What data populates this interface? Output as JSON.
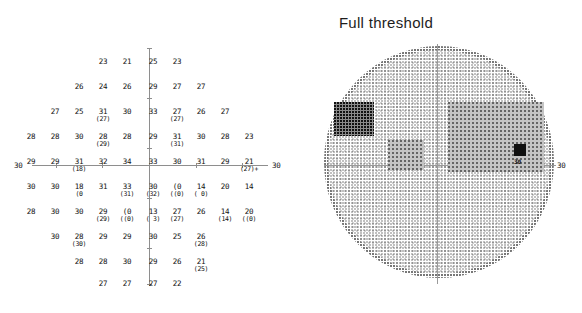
{
  "title": "Full threshold",
  "axis": {
    "left_label": "30",
    "right_label": "30",
    "fieldmap_right_label": "30"
  },
  "chart_data": {
    "type": "table",
    "title": "Full threshold",
    "subtitle": "",
    "xlabel": "",
    "ylabel": "",
    "units": "dB",
    "grid_rows": 10,
    "grid_columns": 10,
    "legend": [],
    "cells": [
      {
        "row": 0,
        "col": 3,
        "main": "23",
        "sub": ""
      },
      {
        "row": 0,
        "col": 4,
        "main": "21",
        "sub": ""
      },
      {
        "row": 0,
        "col": 5,
        "main": "25",
        "sub": ""
      },
      {
        "row": 0,
        "col": 6,
        "main": "23",
        "sub": ""
      },
      {
        "row": 1,
        "col": 2,
        "main": "26",
        "sub": ""
      },
      {
        "row": 1,
        "col": 3,
        "main": "24",
        "sub": ""
      },
      {
        "row": 1,
        "col": 4,
        "main": "26",
        "sub": ""
      },
      {
        "row": 1,
        "col": 5,
        "main": "29",
        "sub": ""
      },
      {
        "row": 1,
        "col": 6,
        "main": "27",
        "sub": ""
      },
      {
        "row": 1,
        "col": 7,
        "main": "27",
        "sub": ""
      },
      {
        "row": 2,
        "col": 1,
        "main": "27",
        "sub": ""
      },
      {
        "row": 2,
        "col": 2,
        "main": "25",
        "sub": ""
      },
      {
        "row": 2,
        "col": 3,
        "main": "31",
        "sub": "(27)"
      },
      {
        "row": 2,
        "col": 4,
        "main": "30",
        "sub": ""
      },
      {
        "row": 2,
        "col": 5,
        "main": "33",
        "sub": ""
      },
      {
        "row": 2,
        "col": 6,
        "main": "27",
        "sub": "(27)"
      },
      {
        "row": 2,
        "col": 7,
        "main": "26",
        "sub": ""
      },
      {
        "row": 2,
        "col": 8,
        "main": "27",
        "sub": ""
      },
      {
        "row": 3,
        "col": 0,
        "main": "28",
        "sub": ""
      },
      {
        "row": 3,
        "col": 1,
        "main": "28",
        "sub": ""
      },
      {
        "row": 3,
        "col": 2,
        "main": "30",
        "sub": ""
      },
      {
        "row": 3,
        "col": 3,
        "main": "28",
        "sub": "(29)"
      },
      {
        "row": 3,
        "col": 4,
        "main": "28",
        "sub": ""
      },
      {
        "row": 3,
        "col": 5,
        "main": "29",
        "sub": ""
      },
      {
        "row": 3,
        "col": 6,
        "main": "31",
        "sub": "(31)"
      },
      {
        "row": 3,
        "col": 7,
        "main": "30",
        "sub": ""
      },
      {
        "row": 3,
        "col": 8,
        "main": "28",
        "sub": ""
      },
      {
        "row": 3,
        "col": 9,
        "main": "23",
        "sub": ""
      },
      {
        "row": 4,
        "col": 0,
        "main": "29",
        "sub": ""
      },
      {
        "row": 4,
        "col": 1,
        "main": "29",
        "sub": ""
      },
      {
        "row": 4,
        "col": 2,
        "main": "31",
        "sub": "(18)"
      },
      {
        "row": 4,
        "col": 3,
        "main": "32",
        "sub": ""
      },
      {
        "row": 4,
        "col": 4,
        "main": "34",
        "sub": ""
      },
      {
        "row": 4,
        "col": 5,
        "main": "33",
        "sub": ""
      },
      {
        "row": 4,
        "col": 6,
        "main": "30",
        "sub": ""
      },
      {
        "row": 4,
        "col": 7,
        "main": "31",
        "sub": ""
      },
      {
        "row": 4,
        "col": 8,
        "main": "29",
        "sub": ""
      },
      {
        "row": 4,
        "col": 9,
        "main": "21",
        "sub": "(27)+"
      },
      {
        "row": 5,
        "col": 0,
        "main": "30",
        "sub": ""
      },
      {
        "row": 5,
        "col": 1,
        "main": "30",
        "sub": ""
      },
      {
        "row": 5,
        "col": 2,
        "main": "18",
        "sub": "(0"
      },
      {
        "row": 5,
        "col": 3,
        "main": "31",
        "sub": ""
      },
      {
        "row": 5,
        "col": 4,
        "main": "33",
        "sub": "(31)"
      },
      {
        "row": 5,
        "col": 5,
        "main": "30",
        "sub": "(32)"
      },
      {
        "row": 5,
        "col": 6,
        "main": "(0",
        "sub": "((0)"
      },
      {
        "row": 5,
        "col": 7,
        "main": "14",
        "sub": "( 0)"
      },
      {
        "row": 5,
        "col": 8,
        "main": "20",
        "sub": ""
      },
      {
        "row": 5,
        "col": 9,
        "main": "14",
        "sub": ""
      },
      {
        "row": 6,
        "col": 0,
        "main": "28",
        "sub": ""
      },
      {
        "row": 6,
        "col": 1,
        "main": "30",
        "sub": ""
      },
      {
        "row": 6,
        "col": 2,
        "main": "30",
        "sub": ""
      },
      {
        "row": 6,
        "col": 3,
        "main": "29",
        "sub": "(29)"
      },
      {
        "row": 6,
        "col": 4,
        "main": "(0",
        "sub": "((0)"
      },
      {
        "row": 6,
        "col": 5,
        "main": "13",
        "sub": "( 3)"
      },
      {
        "row": 6,
        "col": 6,
        "main": "27",
        "sub": "(27)"
      },
      {
        "row": 6,
        "col": 7,
        "main": "26",
        "sub": ""
      },
      {
        "row": 6,
        "col": 8,
        "main": "14",
        "sub": "(14)"
      },
      {
        "row": 6,
        "col": 9,
        "main": "20",
        "sub": "((0)"
      },
      {
        "row": 7,
        "col": 1,
        "main": "30",
        "sub": ""
      },
      {
        "row": 7,
        "col": 2,
        "main": "28",
        "sub": "(30)"
      },
      {
        "row": 7,
        "col": 3,
        "main": "29",
        "sub": ""
      },
      {
        "row": 7,
        "col": 4,
        "main": "29",
        "sub": ""
      },
      {
        "row": 7,
        "col": 5,
        "main": "30",
        "sub": ""
      },
      {
        "row": 7,
        "col": 6,
        "main": "25",
        "sub": ""
      },
      {
        "row": 7,
        "col": 7,
        "main": "26",
        "sub": "(28)"
      },
      {
        "row": 8,
        "col": 2,
        "main": "28",
        "sub": ""
      },
      {
        "row": 8,
        "col": 3,
        "main": "28",
        "sub": ""
      },
      {
        "row": 8,
        "col": 4,
        "main": "30",
        "sub": ""
      },
      {
        "row": 8,
        "col": 5,
        "main": "29",
        "sub": ""
      },
      {
        "row": 8,
        "col": 6,
        "main": "26",
        "sub": ""
      },
      {
        "row": 8,
        "col": 7,
        "main": "21",
        "sub": "(25)"
      },
      {
        "row": 9,
        "col": 3,
        "main": "27",
        "sub": ""
      },
      {
        "row": 9,
        "col": 4,
        "main": "27",
        "sub": ""
      },
      {
        "row": 9,
        "col": 5,
        "main": "27",
        "sub": ""
      },
      {
        "row": 9,
        "col": 6,
        "main": "22",
        "sub": ""
      }
    ],
    "fieldmap": {
      "shape": "circle",
      "axis_label_right": "30",
      "defects": [
        {
          "name": "superior-nasal-dense-scotoma",
          "x": 22,
          "y": 68,
          "w": 26,
          "h": 22,
          "density": "dark"
        },
        {
          "name": "superior-nasal-halo",
          "x": 16,
          "y": 62,
          "w": 40,
          "h": 34,
          "density": "mid"
        },
        {
          "name": "central-dense-spot",
          "x": 78,
          "y": 108,
          "w": 20,
          "h": 14,
          "density": "dark"
        },
        {
          "name": "central-halo",
          "x": 70,
          "y": 100,
          "w": 36,
          "h": 30,
          "density": "light"
        },
        {
          "name": "temporal-dense-band",
          "x": 136,
          "y": 66,
          "w": 34,
          "h": 26,
          "density": "dark"
        },
        {
          "name": "temporal-wedge",
          "x": 130,
          "y": 62,
          "w": 96,
          "h": 70,
          "density": "light"
        },
        {
          "name": "blind-spot",
          "x": 196,
          "y": 104,
          "w": 12,
          "h": 12,
          "density": "solid"
        }
      ],
      "marker_label": "30"
    }
  },
  "grid_geometry": {
    "col_x": [
      6,
      30,
      54,
      78,
      102,
      128,
      152,
      176,
      200,
      224
    ],
    "row_y": [
      18,
      43,
      68,
      93,
      118,
      143,
      168,
      193,
      218,
      240
    ]
  }
}
